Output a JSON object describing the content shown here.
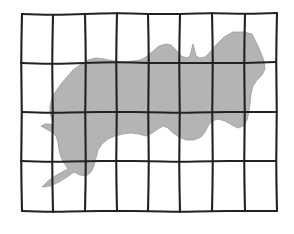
{
  "figure": {
    "title": "Irregular shaded region overlaid with a hand-drawn rectangular grid",
    "caption": "",
    "background_color": "#ffffff"
  },
  "grid": {
    "name": "hand-drawn-grid",
    "columns": 8,
    "rows": 4,
    "vertical_line_count": 9,
    "horizontal_line_count": 5,
    "stroke_color": "#222222",
    "stroke_width": 2.1,
    "style": "hand-drawn-wavy",
    "bounds": {
      "left": 21,
      "top": 13,
      "right": 277,
      "bottom": 212
    },
    "vertical_lines": [
      [
        [
          22,
          14
        ],
        [
          21,
          63
        ],
        [
          22,
          112
        ],
        [
          21,
          161
        ],
        [
          22,
          211
        ]
      ],
      [
        [
          53,
          15
        ],
        [
          52,
          64
        ],
        [
          53,
          113
        ],
        [
          52,
          162
        ],
        [
          53,
          212
        ]
      ],
      [
        [
          85,
          14
        ],
        [
          86,
          63
        ],
        [
          85,
          112
        ],
        [
          86,
          161
        ],
        [
          85,
          211
        ]
      ],
      [
        [
          117,
          13
        ],
        [
          116,
          62
        ],
        [
          117,
          112
        ],
        [
          116,
          161
        ],
        [
          117,
          211
        ]
      ],
      [
        [
          148,
          14
        ],
        [
          149,
          63
        ],
        [
          148,
          112
        ],
        [
          149,
          161
        ],
        [
          148,
          211
        ]
      ],
      [
        [
          180,
          14
        ],
        [
          179,
          63
        ],
        [
          180,
          113
        ],
        [
          179,
          162
        ],
        [
          180,
          212
        ]
      ],
      [
        [
          212,
          13
        ],
        [
          213,
          63
        ],
        [
          212,
          112
        ],
        [
          213,
          161
        ],
        [
          212,
          211
        ]
      ],
      [
        [
          245,
          14
        ],
        [
          244,
          63
        ],
        [
          245,
          112
        ],
        [
          244,
          161
        ],
        [
          245,
          211
        ]
      ],
      [
        [
          277,
          13
        ],
        [
          276,
          62
        ],
        [
          277,
          112
        ],
        [
          276,
          161
        ],
        [
          277,
          211
        ]
      ]
    ],
    "horizontal_lines": [
      [
        [
          22,
          14
        ],
        [
          53,
          15
        ],
        [
          85,
          14
        ],
        [
          117,
          13
        ],
        [
          148,
          14
        ],
        [
          180,
          14
        ],
        [
          212,
          13
        ],
        [
          245,
          14
        ],
        [
          277,
          13
        ]
      ],
      [
        [
          21,
          63
        ],
        [
          52,
          64
        ],
        [
          86,
          63
        ],
        [
          116,
          62
        ],
        [
          149,
          63
        ],
        [
          179,
          63
        ],
        [
          213,
          63
        ],
        [
          244,
          63
        ],
        [
          276,
          62
        ]
      ],
      [
        [
          22,
          112
        ],
        [
          53,
          113
        ],
        [
          85,
          112
        ],
        [
          117,
          112
        ],
        [
          148,
          112
        ],
        [
          180,
          113
        ],
        [
          212,
          112
        ],
        [
          245,
          112
        ],
        [
          277,
          112
        ]
      ],
      [
        [
          21,
          161
        ],
        [
          52,
          162
        ],
        [
          86,
          161
        ],
        [
          116,
          161
        ],
        [
          149,
          161
        ],
        [
          179,
          162
        ],
        [
          213,
          161
        ],
        [
          244,
          161
        ],
        [
          276,
          161
        ]
      ],
      [
        [
          22,
          211
        ],
        [
          53,
          212
        ],
        [
          85,
          211
        ],
        [
          117,
          211
        ],
        [
          148,
          211
        ],
        [
          180,
          212
        ],
        [
          212,
          211
        ],
        [
          245,
          211
        ],
        [
          277,
          211
        ]
      ]
    ]
  },
  "region": {
    "name": "shaded-region",
    "label": "",
    "fill_color": "#b4b4b4",
    "stroke_color": "#9a9a9a",
    "stroke_width": 0.8,
    "outline_points": [
      [
        252,
        34
      ],
      [
        244,
        32
      ],
      [
        233,
        32
      ],
      [
        224,
        37
      ],
      [
        216,
        45
      ],
      [
        210,
        52
      ],
      [
        205,
        57
      ],
      [
        200,
        58
      ],
      [
        196,
        56
      ],
      [
        193,
        44
      ],
      [
        190,
        56
      ],
      [
        187,
        58
      ],
      [
        181,
        56
      ],
      [
        176,
        50
      ],
      [
        171,
        45
      ],
      [
        166,
        44
      ],
      [
        159,
        46
      ],
      [
        152,
        52
      ],
      [
        146,
        57
      ],
      [
        140,
        60
      ],
      [
        133,
        61
      ],
      [
        124,
        62
      ],
      [
        114,
        61
      ],
      [
        104,
        59
      ],
      [
        96,
        58
      ],
      [
        88,
        60
      ],
      [
        80,
        65
      ],
      [
        73,
        70
      ],
      [
        67,
        77
      ],
      [
        61,
        84
      ],
      [
        56,
        91
      ],
      [
        52,
        98
      ],
      [
        50,
        106
      ],
      [
        50,
        113
      ],
      [
        52,
        120
      ],
      [
        54,
        126
      ],
      [
        50,
        124
      ],
      [
        45,
        124
      ],
      [
        41,
        126
      ],
      [
        46,
        129
      ],
      [
        52,
        132
      ],
      [
        56,
        136
      ],
      [
        58,
        142
      ],
      [
        59,
        150
      ],
      [
        61,
        157
      ],
      [
        64,
        163
      ],
      [
        68,
        169
      ],
      [
        62,
        172
      ],
      [
        55,
        176
      ],
      [
        48,
        181
      ],
      [
        42,
        187
      ],
      [
        50,
        186
      ],
      [
        59,
        182
      ],
      [
        67,
        177
      ],
      [
        74,
        172
      ],
      [
        80,
        175
      ],
      [
        86,
        176
      ],
      [
        91,
        172
      ],
      [
        94,
        166
      ],
      [
        96,
        158
      ],
      [
        98,
        150
      ],
      [
        102,
        144
      ],
      [
        108,
        139
      ],
      [
        115,
        136
      ],
      [
        123,
        134
      ],
      [
        131,
        133
      ],
      [
        139,
        134
      ],
      [
        146,
        136
      ],
      [
        152,
        133
      ],
      [
        158,
        129
      ],
      [
        163,
        126
      ],
      [
        168,
        128
      ],
      [
        173,
        133
      ],
      [
        179,
        137
      ],
      [
        186,
        140
      ],
      [
        194,
        140
      ],
      [
        201,
        137
      ],
      [
        205,
        132
      ],
      [
        208,
        126
      ],
      [
        212,
        121
      ],
      [
        218,
        119
      ],
      [
        225,
        121
      ],
      [
        232,
        125
      ],
      [
        238,
        128
      ],
      [
        243,
        126
      ],
      [
        247,
        120
      ],
      [
        249,
        112
      ],
      [
        250,
        103
      ],
      [
        251,
        94
      ],
      [
        253,
        86
      ],
      [
        257,
        80
      ],
      [
        262,
        75
      ],
      [
        265,
        69
      ],
      [
        264,
        61
      ],
      [
        261,
        53
      ],
      [
        257,
        44
      ]
    ]
  }
}
